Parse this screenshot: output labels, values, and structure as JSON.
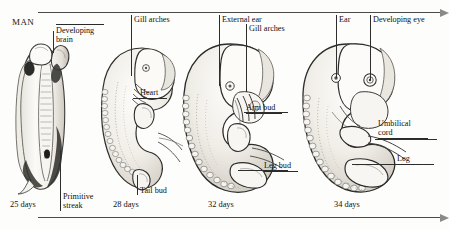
{
  "figure": {
    "heading": "MAN",
    "species_note": "MAN"
  },
  "stages": [
    {
      "id": "stage-25-days",
      "age_label": "25 days",
      "callouts": [
        {
          "name": "developing-brain",
          "text": "Developing\nbrain"
        },
        {
          "name": "primitive-streak",
          "text": "Primitive\nstreak"
        }
      ]
    },
    {
      "id": "stage-28-days",
      "age_label": "28 days",
      "callouts": [
        {
          "name": "gill-arches",
          "text": "Gill arches"
        },
        {
          "name": "heart",
          "text": "Heart"
        },
        {
          "name": "tail-bud",
          "text": "Tail bud"
        }
      ]
    },
    {
      "id": "stage-32-days",
      "age_label": "32 days",
      "callouts": [
        {
          "name": "external-ear",
          "text": "External ear"
        },
        {
          "name": "gill-arches",
          "text": "Gill arches"
        },
        {
          "name": "arm-bud",
          "text": "Arm bud"
        },
        {
          "name": "leg-bud",
          "text": "Leg bud"
        }
      ]
    },
    {
      "id": "stage-34-days",
      "age_label": "34 days",
      "callouts": [
        {
          "name": "ear",
          "text": "Ear"
        },
        {
          "name": "developing-eye",
          "text": "Developing eye"
        },
        {
          "name": "umbilical-cord",
          "text": "Umbilical\ncord"
        },
        {
          "name": "leg",
          "text": "Leg"
        }
      ]
    }
  ],
  "labels": {
    "developing_brain": "Developing\nbrain",
    "primitive_streak": "Primitive\nstreak",
    "gill_arches_28": "Gill arches",
    "heart": "Heart",
    "tail_bud": "Tail bud",
    "external_ear": "External ear",
    "gill_arches_32": "Gill arches",
    "arm_bud": "Arm bud",
    "leg_bud": "Leg bud",
    "ear": "Ear",
    "developing_eye": "Developing eye",
    "umbilical_cord": "Umbilical\ncord",
    "leg": "Leg",
    "days_25": "25 days",
    "days_28": "28 days",
    "days_32": "32 days",
    "days_34": "34 days"
  },
  "colors": {
    "background": "#fdfdfb",
    "ink": "#1a1a1a",
    "rule": "#4a4a4a",
    "leader": "#2e2e2e",
    "shade_light": "#f2f0ec",
    "shade_mid": "#d8d4cc",
    "shade_dark": "#3a3a38"
  }
}
